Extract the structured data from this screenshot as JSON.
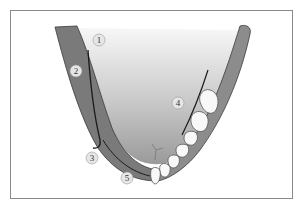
{
  "diagram": {
    "type": "anatomical-illustration",
    "colors": {
      "frame": "#8a8a8a",
      "background": "#ffffff",
      "arch_band": "#7a7a7a",
      "arch_band_outline": "#3a3a3a",
      "inner_gradient_top": "#f4f4f4",
      "inner_gradient_bottom": "#9a9a9a",
      "teeth_fill": "#f8f8f8",
      "teeth_outline": "#555555",
      "curve_line": "#1a1a1a",
      "callout_fill": "#e6e6e6"
    },
    "callouts": [
      {
        "id": "1",
        "label": "1",
        "x": 99,
        "y": 40
      },
      {
        "id": "2",
        "label": "2",
        "x": 76,
        "y": 71
      },
      {
        "id": "3",
        "label": "3",
        "x": 92,
        "y": 158
      },
      {
        "id": "4",
        "label": "4",
        "x": 178,
        "y": 103
      },
      {
        "id": "5",
        "label": "5",
        "x": 127,
        "y": 178
      }
    ],
    "teeth_count_visible": 8
  }
}
